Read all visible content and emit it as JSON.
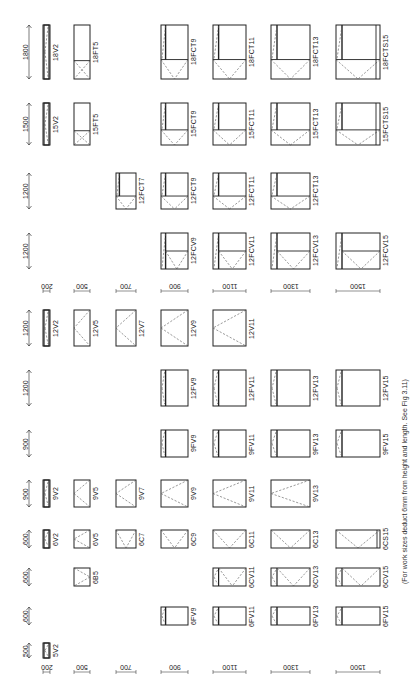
{
  "figure": {
    "note": "(For work sizes deduct 6mm from height and length. See Fig 3.11)",
    "orientation": "rotated 90° counter-clockwise",
    "colors": {
      "line": "#222222",
      "dash": "#555555",
      "background": "#ffffff"
    }
  },
  "columns": [
    {
      "key": "c200",
      "width_label": "200",
      "x": 43,
      "w": 7
    },
    {
      "key": "c500",
      "width_label": "500",
      "x": 74,
      "w": 16
    },
    {
      "key": "c700",
      "width_label": "700",
      "x": 116,
      "w": 20
    },
    {
      "key": "c900",
      "width_label": "900",
      "x": 161,
      "w": 27
    },
    {
      "key": "c1100",
      "width_label": "1100",
      "x": 213,
      "w": 33
    },
    {
      "key": "c1300",
      "width_label": "1300",
      "x": 271,
      "w": 39
    },
    {
      "key": "c1500",
      "width_label": "1500",
      "x": 336,
      "w": 44
    }
  ],
  "height_labels_top": [
    {
      "label": "1800",
      "y": 25,
      "h": 54
    },
    {
      "label": "1500",
      "y": 103,
      "h": 42
    },
    {
      "label": "1200",
      "y": 173,
      "h": 36
    },
    {
      "label": "1200",
      "y": 233,
      "h": 36
    }
  ],
  "height_labels_bottom": [
    {
      "label": "1200",
      "y": 310,
      "h": 36
    },
    {
      "label": "1200",
      "y": 370,
      "h": 36
    },
    {
      "label": "900",
      "y": 430,
      "h": 27
    },
    {
      "label": "900",
      "y": 480,
      "h": 27
    },
    {
      "label": "600",
      "y": 530,
      "h": 18
    },
    {
      "label": "600",
      "y": 568,
      "h": 18
    },
    {
      "label": "600",
      "y": 607,
      "h": 18
    },
    {
      "label": "500",
      "y": 643,
      "h": 15
    }
  ],
  "width_label_rows": [
    {
      "y": 283
    },
    {
      "y": 664
    }
  ],
  "windows": [
    {
      "code": "18V2",
      "col": 0,
      "y": 25,
      "h": 54,
      "type": "V"
    },
    {
      "code": "18FT5",
      "col": 1,
      "y": 25,
      "h": 54,
      "type": "FT"
    },
    {
      "code": "18FCT9",
      "col": 3,
      "y": 25,
      "h": 54,
      "type": "FCT"
    },
    {
      "code": "18FCT11",
      "col": 4,
      "y": 25,
      "h": 54,
      "type": "FCT"
    },
    {
      "code": "18FCT13",
      "col": 5,
      "y": 25,
      "h": 54,
      "type": "FCT"
    },
    {
      "code": "18FCTS15",
      "col": 6,
      "y": 25,
      "h": 54,
      "type": "FCTS"
    },
    {
      "code": "15V2",
      "col": 0,
      "y": 103,
      "h": 42,
      "type": "V"
    },
    {
      "code": "15FT5",
      "col": 1,
      "y": 103,
      "h": 42,
      "type": "FT"
    },
    {
      "code": "15FCT9",
      "col": 3,
      "y": 103,
      "h": 42,
      "type": "FCT"
    },
    {
      "code": "15FCT11",
      "col": 4,
      "y": 103,
      "h": 42,
      "type": "FCT"
    },
    {
      "code": "15FCT13",
      "col": 5,
      "y": 103,
      "h": 42,
      "type": "FCT"
    },
    {
      "code": "15FCTS15",
      "col": 6,
      "y": 103,
      "h": 42,
      "type": "FCTS"
    },
    {
      "code": "12FCT7",
      "col": 2,
      "y": 173,
      "h": 36,
      "type": "FCT"
    },
    {
      "code": "12FCT9",
      "col": 3,
      "y": 173,
      "h": 36,
      "type": "FCT"
    },
    {
      "code": "12FCT11",
      "col": 4,
      "y": 173,
      "h": 36,
      "type": "FCT"
    },
    {
      "code": "12FCT13",
      "col": 5,
      "y": 173,
      "h": 36,
      "type": "FCT"
    },
    {
      "code": "12FCV9",
      "col": 3,
      "y": 233,
      "h": 36,
      "type": "FCV"
    },
    {
      "code": "12FCV11",
      "col": 4,
      "y": 233,
      "h": 36,
      "type": "FCV"
    },
    {
      "code": "12FCV13",
      "col": 5,
      "y": 233,
      "h": 36,
      "type": "FCV"
    },
    {
      "code": "12FCV15",
      "col": 6,
      "y": 233,
      "h": 36,
      "type": "FCV"
    },
    {
      "code": "12V2",
      "col": 0,
      "y": 310,
      "h": 36,
      "type": "V"
    },
    {
      "code": "12V5",
      "col": 1,
      "y": 310,
      "h": 36,
      "type": "V"
    },
    {
      "code": "12V7",
      "col": 2,
      "y": 310,
      "h": 36,
      "type": "V"
    },
    {
      "code": "12V9",
      "col": 3,
      "y": 310,
      "h": 36,
      "type": "V"
    },
    {
      "code": "12V11",
      "col": 4,
      "y": 310,
      "h": 36,
      "type": "V"
    },
    {
      "code": "12FV9",
      "col": 3,
      "y": 370,
      "h": 36,
      "type": "FV"
    },
    {
      "code": "12FV11",
      "col": 4,
      "y": 370,
      "h": 36,
      "type": "FV"
    },
    {
      "code": "12FV13",
      "col": 5,
      "y": 370,
      "h": 36,
      "type": "FV"
    },
    {
      "code": "12FV15",
      "col": 6,
      "y": 370,
      "h": 36,
      "type": "FV"
    },
    {
      "code": "9FV9",
      "col": 3,
      "y": 430,
      "h": 27,
      "type": "FV"
    },
    {
      "code": "9FV11",
      "col": 4,
      "y": 430,
      "h": 27,
      "type": "FV"
    },
    {
      "code": "9FV13",
      "col": 5,
      "y": 430,
      "h": 27,
      "type": "FV"
    },
    {
      "code": "9FV15",
      "col": 6,
      "y": 430,
      "h": 27,
      "type": "FV"
    },
    {
      "code": "9V2",
      "col": 0,
      "y": 480,
      "h": 27,
      "type": "V"
    },
    {
      "code": "9V5",
      "col": 1,
      "y": 480,
      "h": 27,
      "type": "V"
    },
    {
      "code": "9V7",
      "col": 2,
      "y": 480,
      "h": 27,
      "type": "V"
    },
    {
      "code": "9V9",
      "col": 3,
      "y": 480,
      "h": 27,
      "type": "V"
    },
    {
      "code": "9V11",
      "col": 4,
      "y": 480,
      "h": 27,
      "type": "V"
    },
    {
      "code": "9V13",
      "col": 5,
      "y": 480,
      "h": 27,
      "type": "V"
    },
    {
      "code": "6V2",
      "col": 0,
      "y": 530,
      "h": 18,
      "type": "V"
    },
    {
      "code": "6V5",
      "col": 1,
      "y": 530,
      "h": 18,
      "type": "V"
    },
    {
      "code": "6C7",
      "col": 2,
      "y": 530,
      "h": 18,
      "type": "C"
    },
    {
      "code": "6C9",
      "col": 3,
      "y": 530,
      "h": 18,
      "type": "C"
    },
    {
      "code": "6C11",
      "col": 4,
      "y": 530,
      "h": 18,
      "type": "C"
    },
    {
      "code": "6C13",
      "col": 5,
      "y": 530,
      "h": 18,
      "type": "C"
    },
    {
      "code": "6CS15",
      "col": 6,
      "y": 530,
      "h": 18,
      "type": "CS"
    },
    {
      "code": "6B5",
      "col": 1,
      "y": 568,
      "h": 18,
      "type": "B"
    },
    {
      "code": "6CV11",
      "col": 4,
      "y": 568,
      "h": 18,
      "type": "CV"
    },
    {
      "code": "6CV13",
      "col": 5,
      "y": 568,
      "h": 18,
      "type": "CV"
    },
    {
      "code": "6CV15",
      "col": 6,
      "y": 568,
      "h": 18,
      "type": "CV"
    },
    {
      "code": "6FV9",
      "col": 3,
      "y": 607,
      "h": 18,
      "type": "FV"
    },
    {
      "code": "6FV11",
      "col": 4,
      "y": 607,
      "h": 18,
      "type": "FV"
    },
    {
      "code": "6FV13",
      "col": 5,
      "y": 607,
      "h": 18,
      "type": "FV"
    },
    {
      "code": "6FV15",
      "col": 6,
      "y": 607,
      "h": 18,
      "type": "FV"
    },
    {
      "code": "5V2",
      "col": 0,
      "y": 643,
      "h": 15,
      "type": "V"
    }
  ]
}
